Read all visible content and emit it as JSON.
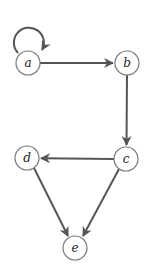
{
  "diagram": {
    "type": "directed-graph",
    "colors": {
      "edge": "#555555",
      "node_stroke": "#7a7a7a",
      "node_fill": "#ffffff",
      "label": "#222222"
    },
    "nodes": [
      {
        "id": "a",
        "label": "a",
        "x": 28,
        "y": 63
      },
      {
        "id": "b",
        "label": "b",
        "x": 127,
        "y": 63
      },
      {
        "id": "c",
        "label": "c",
        "x": 126,
        "y": 159
      },
      {
        "id": "d",
        "label": "d",
        "x": 27,
        "y": 158
      },
      {
        "id": "e",
        "label": "e",
        "x": 75,
        "y": 248
      }
    ],
    "edges": [
      {
        "from": "a",
        "to": "a",
        "kind": "self-loop"
      },
      {
        "from": "a",
        "to": "b"
      },
      {
        "from": "b",
        "to": "c"
      },
      {
        "from": "c",
        "to": "d"
      },
      {
        "from": "d",
        "to": "e"
      },
      {
        "from": "c",
        "to": "e"
      }
    ]
  }
}
